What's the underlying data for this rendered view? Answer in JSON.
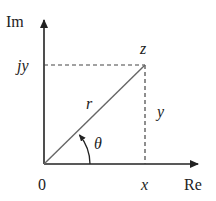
{
  "diagram": {
    "axes": {
      "vertical_label": "Im",
      "horizontal_label": "Re",
      "origin_label": "0"
    },
    "point": {
      "label": "z",
      "real_part_label": "x",
      "imag_part_label": "jy"
    },
    "segments": {
      "radius_label": "r",
      "vertical_leg_label": "y",
      "angle_label": "θ"
    },
    "colors": {
      "axis": "#222222",
      "radius": "#555555",
      "dashed": "#444444",
      "text": "#222222"
    }
  }
}
